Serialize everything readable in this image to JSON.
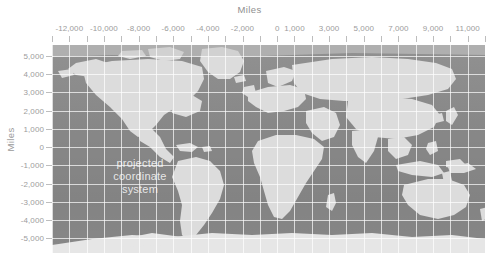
{
  "chart_data": {
    "type": "map",
    "title": "Miles",
    "xlabel": "Miles",
    "ylabel": "Miles",
    "grid": true,
    "legend": "none",
    "projection_note": "projected coordinate system",
    "xlim": [
      -13000,
      12000
    ],
    "ylim": [
      -5800,
      5600
    ],
    "x_tick_interval": 1000,
    "y_tick_interval": 1000,
    "x_ticks": [
      -13000,
      -12000,
      -11000,
      -10000,
      -9000,
      -8000,
      -7000,
      -6000,
      -5000,
      -4000,
      -3000,
      -2000,
      -1000,
      0,
      1000,
      2000,
      3000,
      4000,
      5000,
      6000,
      7000,
      8000,
      9000,
      10000,
      11000,
      12000
    ],
    "x_tick_labels": [
      {
        "value": -12000,
        "label": "-12,000"
      },
      {
        "value": -10000,
        "label": "-10,000"
      },
      {
        "value": -8000,
        "label": "-8,000"
      },
      {
        "value": -6000,
        "label": "-6,000"
      },
      {
        "value": -4000,
        "label": "-4,000"
      },
      {
        "value": -2000,
        "label": "-2,000"
      },
      {
        "value": 0,
        "label": "0"
      },
      {
        "value": 1000,
        "label": "1,000"
      },
      {
        "value": 3000,
        "label": "3,000"
      },
      {
        "value": 5000,
        "label": "5,000"
      },
      {
        "value": 7000,
        "label": "7,000"
      },
      {
        "value": 9000,
        "label": "9,000"
      },
      {
        "value": 11000,
        "label": "11,000"
      }
    ],
    "y_ticks": [
      -5000,
      -4000,
      -3000,
      -2000,
      -1000,
      0,
      1000,
      2000,
      3000,
      4000,
      5000
    ],
    "y_tick_labels": [
      {
        "value": 5000,
        "label": "5,000"
      },
      {
        "value": 4000,
        "label": "4,000"
      },
      {
        "value": 3000,
        "label": "3,000"
      },
      {
        "value": 2000,
        "label": "2,000"
      },
      {
        "value": 1000,
        "label": "1,000"
      },
      {
        "value": 0,
        "label": "0"
      },
      {
        "value": -1000,
        "label": "-1,000"
      },
      {
        "value": -2000,
        "label": "-2,000"
      },
      {
        "value": -3000,
        "label": "-3,000"
      },
      {
        "value": -4000,
        "label": "-4,000"
      },
      {
        "value": -5000,
        "label": "-5,000"
      }
    ],
    "colors": {
      "ocean": "#8a8a8a",
      "land": "#dcdcdc",
      "gridline": "#ffffff",
      "tick_label": "#9c9c9c",
      "axis_title": "#8f8f8f",
      "watermark": "#ffffff",
      "background": "#ffffff"
    }
  },
  "axes": {
    "x_title": "Miles",
    "y_title": "Miles"
  },
  "watermark": {
    "line1": "projected",
    "line2": "coordinate",
    "line3": "system"
  }
}
